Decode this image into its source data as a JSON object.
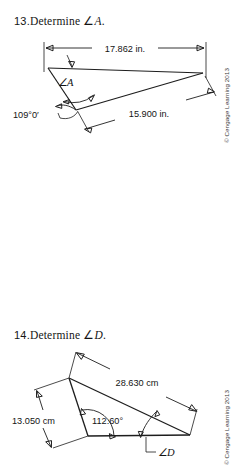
{
  "document": {
    "copyright": "© Cengage Learning 2013"
  },
  "problems": [
    {
      "number": "13.",
      "prompt_text": "Determine ",
      "prompt_symbol": "∠",
      "prompt_variable": "A",
      "prompt_period": ".",
      "figure": {
        "type": "triangle",
        "unknown_angle_label": "∠A",
        "dimensions": [
          {
            "name": "top-side",
            "value": "17.862 in."
          },
          {
            "name": "lower-right-side",
            "value": "15.900 in."
          }
        ],
        "angles": [
          {
            "name": "known-angle",
            "value": "109°0′"
          }
        ]
      }
    },
    {
      "number": "14.",
      "prompt_text": "Determine ",
      "prompt_symbol": "∠",
      "prompt_variable": "D",
      "prompt_period": ".",
      "figure": {
        "type": "triangle",
        "unknown_angle_label": "∠D",
        "dimensions": [
          {
            "name": "long-side",
            "value": "28.630 cm"
          },
          {
            "name": "left-side",
            "value": "13.050 cm"
          }
        ],
        "angles": [
          {
            "name": "known-angle",
            "value": "112.60°"
          }
        ]
      }
    }
  ]
}
